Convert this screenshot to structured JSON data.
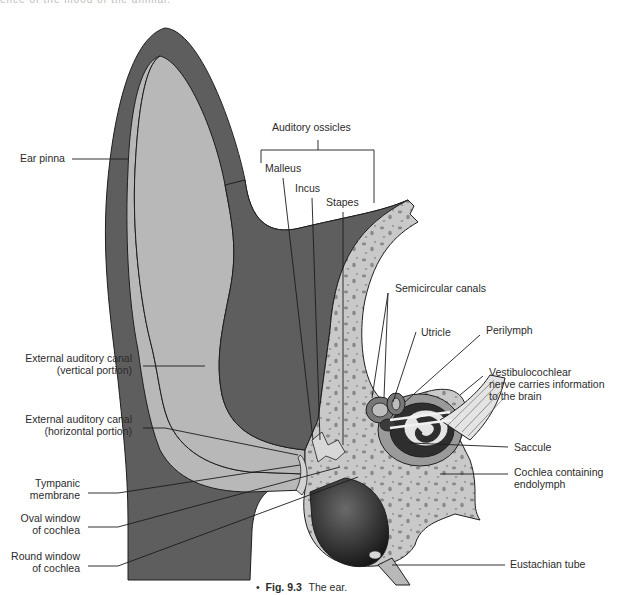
{
  "figure": {
    "caption_number": "Fig. 9.3",
    "caption_text": "The ear.",
    "caption_bullet": "•",
    "cut_off_text": "ence of the mood of the animal."
  },
  "labels": {
    "auditory_ossicles": "Auditory ossicles",
    "malleus": "Malleus",
    "incus": "Incus",
    "stapes": "Stapes",
    "ear_pinna": "Ear pinna",
    "semicircular_canals": "Semicircular canals",
    "utricle": "Utricle",
    "perilymph": "Perilymph",
    "vestibulocochlear_1": "Vestibulocochlear",
    "vestibulocochlear_2": "nerve carries information",
    "vestibulocochlear_3": "to the brain",
    "eac_vertical_1": "External auditory canal",
    "eac_vertical_2": "(vertical portion)",
    "eac_horizontal_1": "External auditory canal",
    "eac_horizontal_2": "(horizontal portion)",
    "saccule": "Saccule",
    "cochlea_1": "Cochlea containing",
    "cochlea_2": "endolymph",
    "tympanic_1": "Tympanic",
    "tympanic_2": "membrane",
    "oval_1": "Oval window",
    "oval_2": "of cochlea",
    "round_1": "Round window",
    "round_2": "of cochlea",
    "eustachian": "Eustachian tube"
  },
  "colors": {
    "tissue_dark": "#5e5e5e",
    "canal_light": "#b8b8b8",
    "bone": "#c9c9c9",
    "bone_spots": "#8a8a8a",
    "outline": "#1e1e1e",
    "text": "#2b2b2b"
  }
}
